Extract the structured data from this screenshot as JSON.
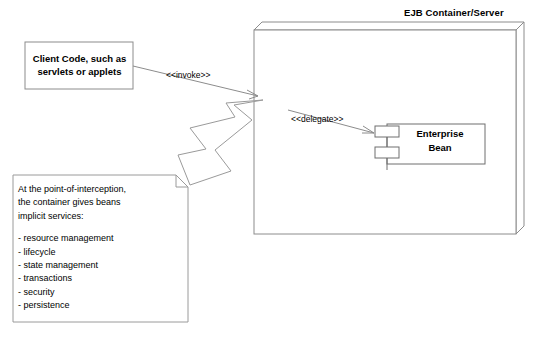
{
  "diagram": {
    "type": "uml-component-deployment",
    "title": "EJB Container/Server",
    "background_color": "#ffffff",
    "line_color": "#808080",
    "text_color": "#000000"
  },
  "container": {
    "title": "EJB Container/Server"
  },
  "client": {
    "label": "Client Code, such as\nservlets or applets",
    "line1": "Client Code, such as",
    "line2": "servlets or applets"
  },
  "bean": {
    "label": "Enterprise\nBean",
    "line1": "Enterprise",
    "line2": "Bean",
    "port_upper": "component-port-upper",
    "port_lower": "component-port-lower"
  },
  "connectors": {
    "invoke": "<<invoke>>",
    "delegate": "<<delegate>>"
  },
  "note": {
    "intro": [
      "At the point-of-interception,",
      "the container gives beans",
      "implicit services:"
    ],
    "services": [
      "- resource management",
      "- lifecycle",
      "- state management",
      "- transactions",
      "- security",
      "- persistence"
    ]
  }
}
